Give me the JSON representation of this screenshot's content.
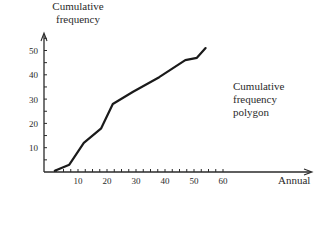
{
  "chart_data": {
    "type": "line",
    "title": "",
    "xlabel": "Annual",
    "ylabel": "Cumulative frequency",
    "annotation": [
      "Cumulative",
      "frequency",
      "polygon"
    ],
    "x_ticks": [
      10,
      20,
      30,
      40,
      50,
      60
    ],
    "y_ticks": [
      10,
      20,
      30,
      40,
      50
    ],
    "xlim": [
      0,
      80
    ],
    "ylim": [
      0,
      58
    ],
    "grid": false,
    "legend": "none",
    "series": [
      {
        "name": "Cumulative frequency polygon",
        "x": [
          2,
          7,
          12,
          18,
          22,
          29,
          38,
          47,
          51,
          54
        ],
        "y": [
          0.5,
          3,
          12,
          18,
          28,
          33,
          39,
          46,
          47,
          51
        ]
      }
    ]
  },
  "style": {
    "line_color": "#1a1a1a",
    "axis_color": "#2a2a2a",
    "text_color": "#2a2a2a"
  }
}
